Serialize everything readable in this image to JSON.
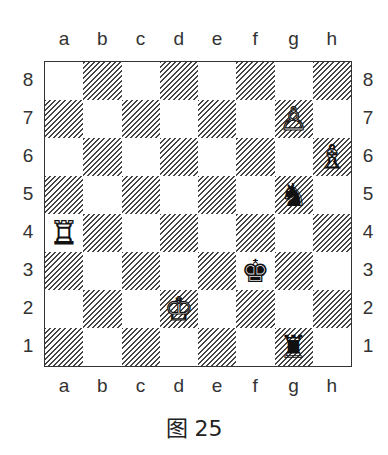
{
  "files": [
    "a",
    "b",
    "c",
    "d",
    "e",
    "f",
    "g",
    "h"
  ],
  "ranks": [
    "8",
    "7",
    "6",
    "5",
    "4",
    "3",
    "2",
    "1"
  ],
  "pieces": [
    {
      "square": "g7",
      "color": "white",
      "type": "pawn",
      "glyph": "♙"
    },
    {
      "square": "h6",
      "color": "white",
      "type": "bishop",
      "glyph": "♗"
    },
    {
      "square": "g5",
      "color": "black",
      "type": "knight",
      "glyph": "♞"
    },
    {
      "square": "a4",
      "color": "white",
      "type": "rook",
      "glyph": "♖"
    },
    {
      "square": "f3",
      "color": "black",
      "type": "king",
      "glyph": "♚"
    },
    {
      "square": "d2",
      "color": "white",
      "type": "king",
      "glyph": "♔"
    },
    {
      "square": "g1",
      "color": "black",
      "type": "rook",
      "glyph": "♜"
    }
  ],
  "caption": "图 25"
}
